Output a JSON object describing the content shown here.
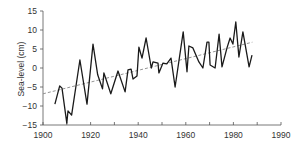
{
  "chart_data": {
    "type": "line",
    "title": "",
    "xlabel": "",
    "ylabel": "Sea-level (cm)",
    "xlim": [
      1900,
      1990
    ],
    "ylim": [
      -15,
      15
    ],
    "grid": false,
    "legend": null,
    "x_tick_labels": [
      "1900",
      "1920",
      "1940",
      "1960",
      "1980",
      "1990"
    ],
    "x_tick_count": 11,
    "y_ticks": [
      15,
      10,
      5,
      0,
      -5,
      -10,
      -15
    ],
    "y_tick_labels": [
      "15",
      "10",
      "5",
      "0",
      "-5",
      "-10",
      "-15"
    ],
    "series": [
      {
        "name": "Sea-level",
        "style": "solid",
        "color": "#1a1a1a",
        "x": [
          1905,
          1907,
          1908,
          1910,
          1910.5,
          1912,
          1915.5,
          1918.5,
          1921,
          1923,
          1925,
          1925.6,
          1928.5,
          1931.5,
          1934.5,
          1935.7,
          1937,
          1937.8,
          1939.5,
          1940.3,
          1941.6,
          1943.3,
          1945.5,
          1946.2,
          1948.3,
          1948.7,
          1950.4,
          1952,
          1953.8,
          1955.5,
          1958.9,
          1960.5,
          1961.3,
          1963,
          1965.5,
          1967.2,
          1968.9,
          1969.7,
          1970.2,
          1972.3,
          1974,
          1975.2,
          1977.3,
          1978.6,
          1979.8,
          1981,
          1982.3,
          1984,
          1986.6,
          1987.8
        ],
        "values": [
          -9.5,
          -4.7,
          -5.3,
          -14.5,
          -11.3,
          -12.4,
          2.1,
          -9.5,
          6.3,
          -1.8,
          -5.5,
          -1.3,
          -6.8,
          -0.8,
          -6.3,
          -0.5,
          -0.3,
          -2.9,
          -2.1,
          5.5,
          2.6,
          7.9,
          0,
          1.6,
          1.3,
          -1.3,
          1.3,
          1.1,
          2.6,
          -5,
          9.5,
          -1,
          5.8,
          5.3,
          1.6,
          0,
          6.8,
          6.8,
          0.8,
          0,
          8.9,
          0.3,
          5.3,
          7.9,
          6.3,
          12.1,
          2.9,
          9.5,
          0.3,
          3.4
        ]
      },
      {
        "name": "Linear trend",
        "style": "dashed",
        "color": "#888888",
        "x": [
          1900,
          1988
        ],
        "values": [
          -6.8,
          6.8
        ]
      }
    ]
  }
}
